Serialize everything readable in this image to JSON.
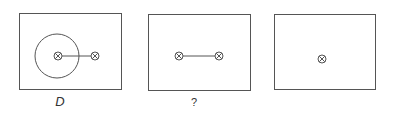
{
  "colors": {
    "stroke": "#555555",
    "text": "#333333",
    "background": "#ffffff"
  },
  "panels": [
    {
      "name": "panel-d",
      "label": "D",
      "box": {
        "x": 19.5,
        "y": 13.5,
        "w": 102,
        "h": 76
      },
      "circle": {
        "cx": 57,
        "cy": 56,
        "r": 22
      },
      "nodes": [
        {
          "x": 58,
          "y": 56
        },
        {
          "x": 95,
          "y": 56
        }
      ],
      "edges": [
        [
          0,
          1
        ]
      ]
    },
    {
      "name": "panel-question",
      "label": "?",
      "box": {
        "x": 148.5,
        "y": 14.5,
        "w": 102,
        "h": 76
      },
      "nodes": [
        {
          "x": 179,
          "y": 56
        },
        {
          "x": 219,
          "y": 56
        }
      ],
      "edges": [
        [
          0,
          1
        ]
      ]
    },
    {
      "name": "panel-third",
      "label": "",
      "box": {
        "x": 274.5,
        "y": 14.5,
        "w": 101,
        "h": 75
      },
      "nodes": [
        {
          "x": 322,
          "y": 59
        }
      ],
      "edges": []
    }
  ],
  "node_symbol": "circled-times"
}
